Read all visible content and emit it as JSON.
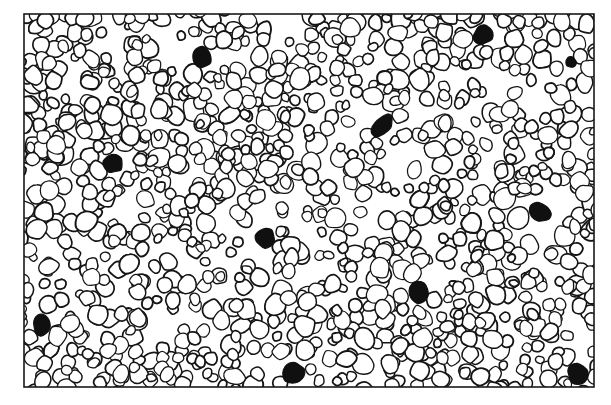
{
  "figure": {
    "kind": "scientific-illustration",
    "caption": "",
    "background_color": "#ffffff",
    "ink_color": "#151515",
    "dark_cell_fill": "#101010",
    "cell_fill": "#ffffff",
    "frame": {
      "name": "field-border-rectangle",
      "x": 24,
      "y": 14,
      "width": 570,
      "height": 373,
      "stroke_color": "#1a1a1a",
      "stroke_width": 1.6
    },
    "canvas": {
      "width": 611,
      "height": 405
    },
    "pale_sweep": {
      "present": true,
      "description": "diagonal lower-density band running from lower-left to upper-right"
    },
    "cell_outline": {
      "stroke_color": "#151515",
      "stroke_width": 1.45,
      "min_radius": 4.2,
      "max_radius": 10.5,
      "approx_count": 1150
    },
    "dark_cells": [
      {
        "name": "dark-cell-1",
        "cx": 202,
        "cy": 57,
        "rx": 10.5,
        "ry": 9.5
      },
      {
        "name": "dark-cell-2",
        "cx": 483,
        "cy": 35,
        "rx": 10.0,
        "ry": 9.2
      },
      {
        "name": "dark-cell-3",
        "cx": 382,
        "cy": 125,
        "rx": 13.5,
        "ry": 7.5
      },
      {
        "name": "dark-cell-4",
        "cx": 113,
        "cy": 163,
        "rx": 9.8,
        "ry": 9.6
      },
      {
        "name": "dark-cell-5",
        "cx": 540,
        "cy": 212,
        "rx": 11.0,
        "ry": 8.5
      },
      {
        "name": "dark-cell-6",
        "cx": 265,
        "cy": 238,
        "rx": 9.5,
        "ry": 9.8
      },
      {
        "name": "dark-cell-7",
        "cx": 418,
        "cy": 292,
        "rx": 10.8,
        "ry": 10.0
      },
      {
        "name": "dark-cell-8",
        "cx": 42,
        "cy": 325,
        "rx": 10.5,
        "ry": 8.6
      },
      {
        "name": "dark-cell-9",
        "cx": 293,
        "cy": 373,
        "rx": 10.8,
        "ry": 9.5
      },
      {
        "name": "dark-cell-10",
        "cx": 578,
        "cy": 374,
        "rx": 11.2,
        "ry": 9.8
      },
      {
        "name": "dark-cell-11",
        "cx": 571,
        "cy": 62,
        "rx": 5.0,
        "ry": 5.0
      }
    ],
    "dark_cell_count": 11
  }
}
